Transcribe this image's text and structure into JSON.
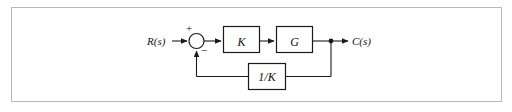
{
  "figure": {
    "type": "control-system-block-diagram",
    "caption": "",
    "background_color": "#ffffff",
    "border_color": "#b9b9bb",
    "line_color": "#1a1a1a"
  },
  "signals": {
    "input_label": "R(s)",
    "output_label": "C(s)"
  },
  "summing_junction": {
    "name": "summing-junction",
    "positive_sign": "+",
    "negative_sign": "−"
  },
  "blocks": [
    {
      "id": "gain-k",
      "label": "K"
    },
    {
      "id": "plant-g",
      "label": "G"
    },
    {
      "id": "feedback-inv-k",
      "label": "1/K"
    }
  ],
  "connections": [
    {
      "from": "R(s)",
      "to": "summing-junction"
    },
    {
      "from": "summing-junction",
      "to": "K"
    },
    {
      "from": "K",
      "to": "G"
    },
    {
      "from": "G",
      "to": "C(s)"
    },
    {
      "from": "takeoff-node",
      "to": "1/K"
    },
    {
      "from": "1/K",
      "to": "summing-junction"
    }
  ]
}
